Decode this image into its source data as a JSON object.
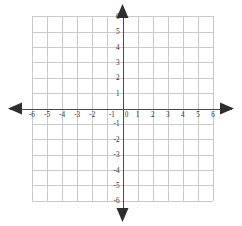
{
  "figure": {
    "title": ""
  },
  "chart_data": {
    "type": "scatter",
    "title": "",
    "xlabel": "",
    "ylabel": "",
    "xlim": [
      -6,
      6
    ],
    "ylim": [
      -6,
      6
    ],
    "grid": true,
    "legend": null,
    "series": [],
    "x_tick_labels": [
      "-6",
      "-5",
      "-4",
      "-3",
      "-2",
      "-1",
      "0",
      "1",
      "2",
      "3",
      "4",
      "5",
      "6"
    ],
    "x_tick_values": [
      -6,
      -5,
      -4,
      -3,
      -2,
      -1,
      0,
      1,
      2,
      3,
      4,
      5,
      6
    ],
    "y_tick_labels": [
      "6",
      "5",
      "4",
      "3",
      "2",
      "1",
      "-1",
      "-2",
      "-3",
      "-4",
      "-5",
      "-6"
    ],
    "y_tick_values": [
      6,
      5,
      4,
      3,
      2,
      1,
      -1,
      -2,
      -3,
      -4,
      -5,
      -6
    ],
    "origin_label": "0",
    "grid_step": 1,
    "axis_arrows": [
      "left",
      "right",
      "up",
      "down"
    ],
    "colors": {
      "grid": "#c9c9c9",
      "axis": "#4a4a4a",
      "arrow": "#2e2e2e",
      "label": "#303030",
      "background": "#ffffff"
    }
  }
}
